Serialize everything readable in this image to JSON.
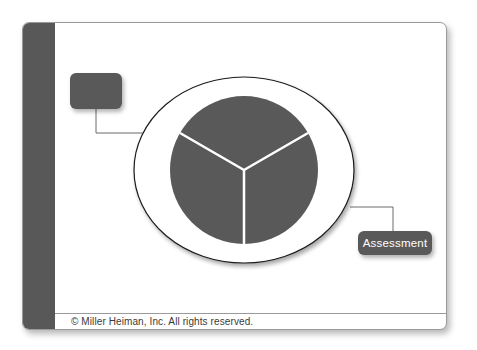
{
  "diagram": {
    "boxes": [
      {
        "id": "top-left-box",
        "label": ""
      },
      {
        "id": "assessment-box",
        "label": "Assessment"
      }
    ],
    "pie": {
      "segments": 3,
      "segment_labels": [
        "",
        "",
        ""
      ]
    },
    "colors": {
      "sidebar": "#585858",
      "box_fill": "#595959",
      "pie_fill": "#595959",
      "divider_lines": "#ffffff",
      "outline": "#1a1a1a"
    }
  },
  "footer": {
    "copyright": "© Miller Heiman, Inc. All rights reserved."
  }
}
